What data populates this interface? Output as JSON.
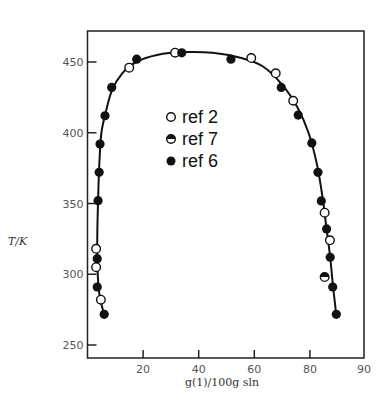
{
  "chart_data": {
    "type": "scatter",
    "title": "",
    "xlabel": "g(1)/100g sln",
    "ylabel": "T/K",
    "xlim": [
      0,
      90
    ],
    "ylim": [
      240,
      470
    ],
    "x_ticks": [
      20,
      40,
      60,
      80,
      90
    ],
    "y_ticks": [
      250,
      300,
      350,
      400,
      450
    ],
    "grid": false,
    "legend_position": "center-inside",
    "legend": [
      {
        "label": "ref 2",
        "marker": "open-circle"
      },
      {
        "label": "ref 7",
        "marker": "half-filled-circle"
      },
      {
        "label": "ref 6",
        "marker": "filled-circle"
      }
    ],
    "series": [
      {
        "name": "ref 2",
        "marker": "open-circle",
        "points": [
          {
            "x": 3.1,
            "T": 318
          },
          {
            "x": 3.1,
            "T": 305
          },
          {
            "x": 4.8,
            "T": 282
          },
          {
            "x": 15.0,
            "T": 446
          },
          {
            "x": 31.5,
            "T": 456.6
          },
          {
            "x": 58.9,
            "T": 452.8
          },
          {
            "x": 67.7,
            "T": 442
          },
          {
            "x": 74.0,
            "T": 422.6
          },
          {
            "x": 85.3,
            "T": 343.5
          },
          {
            "x": 87.2,
            "T": 324
          }
        ]
      },
      {
        "name": "ref 7",
        "marker": "half-filled-circle",
        "points": [
          {
            "x": 85.3,
            "T": 298
          }
        ]
      },
      {
        "name": "ref 6",
        "marker": "filled-circle",
        "points": [
          {
            "x": 6.0,
            "T": 271.7
          },
          {
            "x": 3.5,
            "T": 291
          },
          {
            "x": 3.5,
            "T": 311
          },
          {
            "x": 3.8,
            "T": 352
          },
          {
            "x": 4.2,
            "T": 372
          },
          {
            "x": 4.5,
            "T": 392
          },
          {
            "x": 6.3,
            "T": 412
          },
          {
            "x": 8.7,
            "T": 432
          },
          {
            "x": 17.7,
            "T": 452
          },
          {
            "x": 33.9,
            "T": 456.5
          },
          {
            "x": 51.6,
            "T": 452
          },
          {
            "x": 69.7,
            "T": 432
          },
          {
            "x": 75.8,
            "T": 412.5
          },
          {
            "x": 80.7,
            "T": 392.8
          },
          {
            "x": 82.9,
            "T": 372
          },
          {
            "x": 84.1,
            "T": 351.8
          },
          {
            "x": 86.0,
            "T": 332
          },
          {
            "x": 87.3,
            "T": 312
          },
          {
            "x": 88.2,
            "T": 291
          },
          {
            "x": 89.5,
            "T": 271.7
          }
        ]
      }
    ],
    "fitted_curve": {
      "description": "solubility curve (solid line) through all data",
      "points": [
        {
          "x": 6.0,
          "T": 271
        },
        {
          "x": 4.0,
          "T": 290
        },
        {
          "x": 3.5,
          "T": 320
        },
        {
          "x": 3.8,
          "T": 352
        },
        {
          "x": 4.3,
          "T": 380
        },
        {
          "x": 5.0,
          "T": 400
        },
        {
          "x": 6.5,
          "T": 414
        },
        {
          "x": 8.8,
          "T": 430
        },
        {
          "x": 12.5,
          "T": 442
        },
        {
          "x": 17.5,
          "T": 450
        },
        {
          "x": 25.0,
          "T": 455
        },
        {
          "x": 35.0,
          "T": 457
        },
        {
          "x": 45.0,
          "T": 456.5
        },
        {
          "x": 55.0,
          "T": 453
        },
        {
          "x": 63.0,
          "T": 447
        },
        {
          "x": 70.0,
          "T": 434
        },
        {
          "x": 75.5,
          "T": 418
        },
        {
          "x": 79.5,
          "T": 400
        },
        {
          "x": 82.5,
          "T": 378
        },
        {
          "x": 84.5,
          "T": 355
        },
        {
          "x": 86.0,
          "T": 332
        },
        {
          "x": 87.3,
          "T": 312
        },
        {
          "x": 88.3,
          "T": 292
        },
        {
          "x": 89.5,
          "T": 271
        }
      ]
    }
  },
  "labels": {
    "xlabel": "g(1)/100g sln",
    "ylabel": "T/K",
    "x_tick_labels": [
      "20",
      "40",
      "60",
      "80",
      "90"
    ],
    "y_tick_labels": [
      "250",
      "300",
      "350",
      "400",
      "450"
    ],
    "legend": [
      "ref 2",
      "ref 7",
      "ref 6"
    ]
  }
}
